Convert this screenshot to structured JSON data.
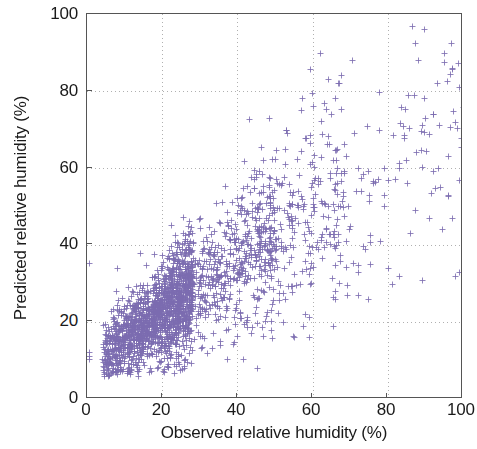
{
  "chart_data": {
    "type": "scatter",
    "title": "",
    "xlabel": "Observed relative humidity (%)",
    "ylabel": "Predicted relative humidity (%)",
    "xlim": [
      0,
      100
    ],
    "ylim": [
      0,
      100
    ],
    "xticks": [
      0,
      20,
      40,
      60,
      80,
      100
    ],
    "yticks": [
      0,
      20,
      40,
      60,
      80,
      100
    ],
    "xtick_labels": [
      "0",
      "20",
      "40",
      "60",
      "80",
      "100"
    ],
    "ytick_labels": [
      "0",
      "20",
      "40",
      "60",
      "80",
      "100"
    ],
    "grid": true,
    "grid_style": "dotted",
    "grid_color": "#b0b0b0",
    "legend": null,
    "marker": "plus",
    "marker_color": "#7b6bb0",
    "marker_size": 4,
    "n_points": 2400,
    "series": [
      {
        "name": "Predicted vs observed relative humidity",
        "description": "Dense positively-correlated cloud: tight high-density core from (4,6) to (30,35) broadening along a roughly 1:1 to 1.3:1 trend, with increasing scatter above x=40 and sparse outliers out to x=100, y=90.",
        "correlation": 0.82,
        "trend_slope": 0.78,
        "trend_intercept": 8.0
      }
    ]
  },
  "axes": {
    "x_label": "Observed relative humidity (%)",
    "y_label": "Predicted relative humidity (%)",
    "x_ticks": [
      "0",
      "20",
      "40",
      "60",
      "80",
      "100"
    ],
    "y_ticks": [
      "0",
      "20",
      "40",
      "60",
      "80",
      "100"
    ]
  },
  "colors": {
    "marker": "#7b6bb0",
    "axis": "#555555",
    "grid": "#b0b0b0",
    "text": "#1a1a1a",
    "background": "#ffffff"
  }
}
